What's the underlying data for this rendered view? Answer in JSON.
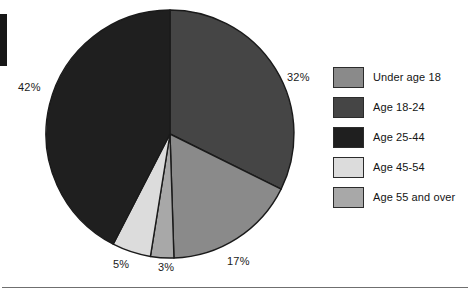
{
  "chart_data": {
    "type": "pie",
    "title": "",
    "categories": [
      "Under age 18",
      "Age 18-24",
      "Age 25-44",
      "Age 45-54",
      "Age 55 and over"
    ],
    "values": [
      17,
      32,
      42,
      5,
      3
    ],
    "value_labels": [
      "17%",
      "32%",
      "42%",
      "5%",
      "3%"
    ],
    "units": "percent",
    "legend_position": "right",
    "grid": false,
    "start_angle_deg": 0,
    "direction": "clockwise",
    "slice_order": [
      "Age 18-24",
      "Under age 18",
      "Age 55 and over",
      "Age 45-54",
      "Age 25-44"
    ],
    "colors": {
      "Under age 18": "#8a8a8a",
      "Age 18-24": "#454545",
      "Age 25-44": "#1f1f1f",
      "Age 45-54": "#dcdcdc",
      "Age 55 and over": "#a8a8a8"
    },
    "slice_outline_color": "#1a1a1a"
  },
  "slices": [
    {
      "key": "age-18-24",
      "label": "32%",
      "value": 32,
      "color": "#454545"
    },
    {
      "key": "under-age-18",
      "label": "17%",
      "value": 17,
      "color": "#8a8a8a"
    },
    {
      "key": "age-55-and-over",
      "label": "3%",
      "value": 3,
      "color": "#a8a8a8"
    },
    {
      "key": "age-45-54",
      "label": "5%",
      "value": 5,
      "color": "#dcdcdc"
    },
    {
      "key": "age-25-44",
      "label": "42%",
      "value": 42,
      "color": "#1f1f1f"
    }
  ],
  "legend": {
    "items": [
      {
        "label": "Under age 18",
        "color": "#8a8a8a"
      },
      {
        "label": "Age 18-24",
        "color": "#454545"
      },
      {
        "label": "Age 25-44",
        "color": "#1f1f1f"
      },
      {
        "label": "Age 45-54",
        "color": "#dcdcdc"
      },
      {
        "label": "Age 55 and over",
        "color": "#a8a8a8"
      }
    ]
  }
}
